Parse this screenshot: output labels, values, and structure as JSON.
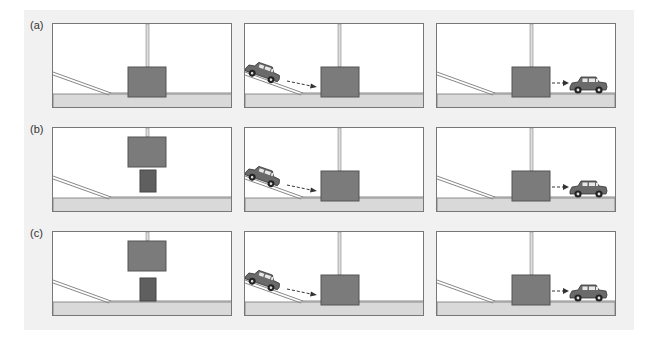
{
  "figure": {
    "rows": [
      {
        "label": "(a)",
        "panels": [
          {
            "state": "initial",
            "pole": "full",
            "block": "lowered",
            "small_block": false,
            "car": null
          },
          {
            "state": "car-on-ramp",
            "pole": "full",
            "block": "lowered",
            "small_block": false,
            "car": "ramp",
            "arrow": "toward-block"
          },
          {
            "state": "car-exited",
            "pole": "full",
            "block": "lowered",
            "small_block": false,
            "car": "exit",
            "arrow": "from-block"
          }
        ]
      },
      {
        "label": "(b)",
        "panels": [
          {
            "state": "initial",
            "pole": "short",
            "block": "raised",
            "small_block": true,
            "car": null
          },
          {
            "state": "car-on-ramp",
            "pole": "full",
            "block": "lowered",
            "small_block": false,
            "car": "ramp",
            "arrow": "toward-block"
          },
          {
            "state": "car-exited",
            "pole": "full",
            "block": "lowered",
            "small_block": false,
            "car": "exit",
            "arrow": "from-block"
          }
        ]
      },
      {
        "label": "(c)",
        "panels": [
          {
            "state": "initial",
            "pole": "short",
            "block": "raised",
            "small_block": true,
            "car": null
          },
          {
            "state": "car-on-ramp",
            "pole": "full",
            "block": "lowered",
            "small_block": false,
            "car": "ramp",
            "arrow": "toward-block"
          },
          {
            "state": "car-exited",
            "pole": "full",
            "block": "lowered",
            "small_block": false,
            "car": "exit",
            "arrow": "from-block"
          }
        ]
      }
    ],
    "colors": {
      "background": "#f1f1f1",
      "panel": "#ffffff",
      "ground": "#d9d9d9",
      "block": "#7b7b7b",
      "small_block": "#5f5f5f",
      "outline": "#555555",
      "car": "#6a6a6a"
    }
  }
}
